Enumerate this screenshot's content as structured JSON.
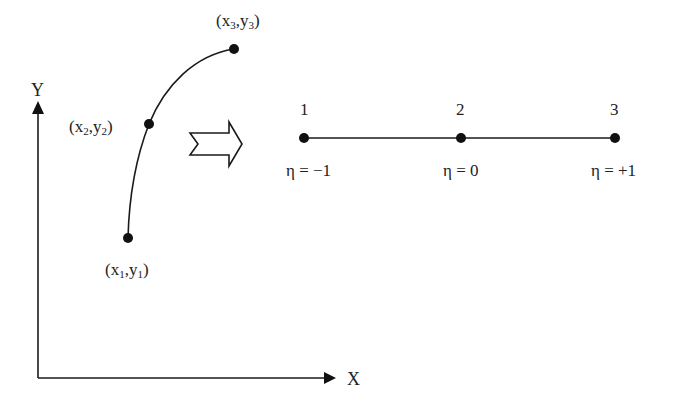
{
  "diagram": {
    "title": "",
    "type": "isoparametric-mapping",
    "colors": {
      "stroke": "#1a1a1a",
      "node": "#111111",
      "background": "#ffffff"
    },
    "global_axes": {
      "x_label": "X",
      "y_label": "Y",
      "origin": [
        38,
        378
      ],
      "x_end": [
        334,
        378
      ],
      "y_end": [
        38,
        102
      ]
    },
    "curved_element": {
      "nodes": [
        {
          "id": 1,
          "label_x": "x",
          "label_y": "y",
          "sub": "1",
          "pos": [
            128,
            238
          ]
        },
        {
          "id": 2,
          "label_x": "x",
          "label_y": "y",
          "sub": "2",
          "pos": [
            149,
            124
          ]
        },
        {
          "id": 3,
          "label_x": "x",
          "label_y": "y",
          "sub": "3",
          "pos": [
            234,
            49
          ]
        }
      ]
    },
    "mapping_arrow": {
      "icon": "hollow-right-arrow-icon"
    },
    "natural_element": {
      "nodes": [
        {
          "id": "1",
          "eta_label": "η = −1",
          "pos": [
            304,
            138
          ]
        },
        {
          "id": "2",
          "eta_label": "η = 0",
          "pos": [
            461,
            138
          ]
        },
        {
          "id": "3",
          "eta_label": "η = +1",
          "pos": [
            615,
            138
          ]
        }
      ]
    }
  }
}
